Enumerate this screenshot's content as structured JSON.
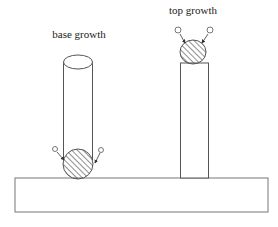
{
  "labels": {
    "base": "base growth",
    "top": "top growth"
  },
  "colors": {
    "stroke": "#555555",
    "background": "#ffffff",
    "hatch": "#444444"
  },
  "geometry": {
    "substrate": {
      "x": 15,
      "y": 178,
      "width": 253,
      "height": 34
    },
    "base_cylinder": {
      "x": 63,
      "y": 62,
      "width": 29,
      "height": 116,
      "ellipse_ry": 7
    },
    "base_catalyst": {
      "cx": 78,
      "cy": 165,
      "r": 15
    },
    "top_column": {
      "x": 180,
      "y": 63,
      "width": 28,
      "height": 115
    },
    "top_catalyst": {
      "cx": 193,
      "cy": 52,
      "r": 13
    }
  }
}
